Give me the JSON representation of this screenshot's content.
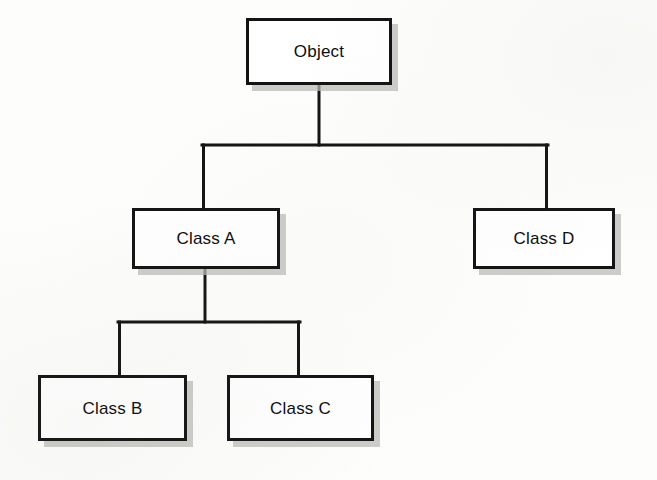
{
  "diagram": {
    "type": "tree-diagram",
    "background_color": "#fdfdfb",
    "box_fill_color": "#ffffff",
    "border_color": "#131313",
    "shadow_color": "#b9b9b4",
    "connector_color": "#131313",
    "nodes": [
      {
        "id": "object",
        "label": "Object",
        "x": 246,
        "y": 18,
        "width": 146,
        "height": 67
      },
      {
        "id": "class_a",
        "label": "Class A",
        "x": 132,
        "y": 208,
        "width": 148,
        "height": 61
      },
      {
        "id": "class_d",
        "label": "Class D",
        "x": 473,
        "y": 208,
        "width": 142,
        "height": 61
      },
      {
        "id": "class_b",
        "label": "Class B",
        "x": 38,
        "y": 375,
        "width": 149,
        "height": 66
      },
      {
        "id": "class_c",
        "label": "Class C",
        "x": 227,
        "y": 375,
        "width": 147,
        "height": 66
      }
    ],
    "edges": [
      {
        "id": "object-to-class-a",
        "from": "object",
        "to": "class_a",
        "style": "orthogonal"
      },
      {
        "id": "object-to-class-d",
        "from": "object",
        "to": "class_d",
        "style": "orthogonal"
      },
      {
        "id": "class-a-to-class-b",
        "from": "class_a",
        "to": "class_b",
        "style": "orthogonal"
      },
      {
        "id": "class-a-to-class-c",
        "from": "class_a",
        "to": "class_c",
        "style": "orthogonal"
      }
    ]
  }
}
